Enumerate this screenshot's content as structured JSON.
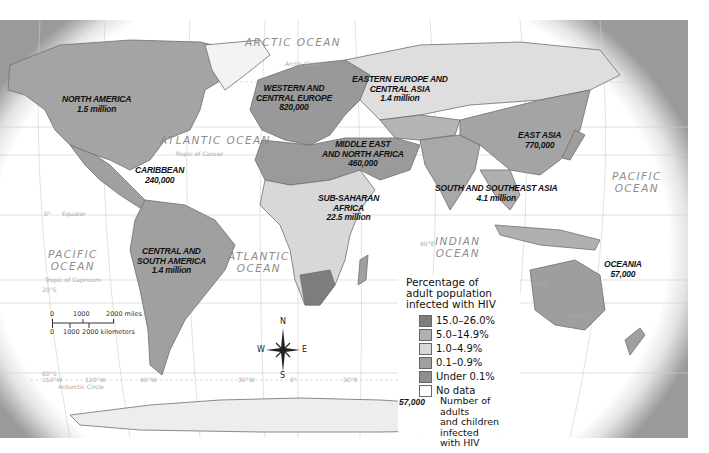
{
  "map": {
    "title": "Adults and children infected with HIV by world region",
    "regions": [
      {
        "name": "NORTH AMERICA",
        "value": "1.5 million"
      },
      {
        "name": "CARIBBEAN",
        "value": "240,000"
      },
      {
        "name": "CENTRAL AND SOUTH AMERICA",
        "value": "1.4 million"
      },
      {
        "name": "WESTERN AND CENTRAL EUROPE",
        "value": "820,000"
      },
      {
        "name": "EASTERN EUROPE AND CENTRAL ASIA",
        "value": "1.4 million"
      },
      {
        "name": "MIDDLE EAST AND NORTH AFRICA",
        "value": "460,000"
      },
      {
        "name": "SUB-SAHARAN AFRICA",
        "value": "22.5 million"
      },
      {
        "name": "SOUTH AND SOUTHEAST ASIA",
        "value": "4.1 million"
      },
      {
        "name": "EAST ASIA",
        "value": "770,000"
      },
      {
        "name": "OCEANIA",
        "value": "57,000"
      }
    ],
    "labels": {
      "na_l1": "NORTH AMERICA",
      "na_v": "1.5 million",
      "car_l1": "CARIBBEAN",
      "car_v": "240,000",
      "csa_l1": "CENTRAL AND",
      "csa_l2": "SOUTH AMERICA",
      "csa_v": "1.4 million",
      "wce_l1": "WESTERN AND",
      "wce_l2": "CENTRAL EUROPE",
      "wce_v": "820,000",
      "eeca_l1": "EASTERN EUROPE AND",
      "eeca_l2": "CENTRAL ASIA",
      "eeca_v": "1.4 million",
      "mena_l1": "MIDDLE EAST",
      "mena_l2": "AND NORTH AFRICA",
      "mena_v": "460,000",
      "ssa_l1": "SUB-SAHARAN",
      "ssa_l2": "AFRICA",
      "ssa_v": "22.5 million",
      "ssea_l1": "SOUTH AND SOUTHEAST ASIA",
      "ssea_v": "4.1 million",
      "ea_l1": "EAST ASIA",
      "ea_v": "770,000",
      "oc_l1": "OCEANIA",
      "oc_v": "57,000"
    },
    "oceans": {
      "arctic": "ARCTIC OCEAN",
      "atlantic_n": "ATLANTIC OCEAN",
      "atlantic_s1": "ATLANTIC",
      "atlantic_s2": "OCEAN",
      "pacific_w1": "PACIFIC",
      "pacific_w2": "OCEAN",
      "pacific_e1": "PACIFIC",
      "pacific_e2": "OCEAN",
      "indian1": "INDIAN",
      "indian2": "OCEAN"
    },
    "grid": {
      "arctic_circle": "Arctic Circle",
      "tropic_cancer": "Tropic of Cancer",
      "equator": "Equator",
      "tropic_capricorn": "Tropic of Capricorn",
      "antarctic_circle": "Antarctic Circle",
      "lat_0": "0°",
      "lat_20n": "20°N",
      "lat_20s": "20°S",
      "lat_60s": "60°S",
      "lon_150w": "150°W",
      "lon_120w": "120°W",
      "lon_90w": "90°W",
      "lon_30w": "30°W",
      "lon_0": "0°",
      "lon_30e": "30°E",
      "lon_90e": "90°E",
      "lon_120e": "120°E",
      "lon_150e": "150°E"
    },
    "compass": {
      "n": "N",
      "s": "S",
      "e": "E",
      "w": "W"
    },
    "scale": {
      "miles_0": "0",
      "miles_1000": "1000",
      "miles_2000": "2000 miles",
      "km_0": "0",
      "km_1000": "1000",
      "km_2000": "2000 kilometers"
    }
  },
  "legend": {
    "title_l1": "Percentage of",
    "title_l2": "adult population",
    "title_l3": "infected with HIV",
    "items": [
      {
        "label": "15.0–26.0%",
        "color": "#7d7d7d"
      },
      {
        "label": "5.0–14.9%",
        "color": "#b0b0b0"
      },
      {
        "label": "1.0–4.9%",
        "color": "#d8d8d8"
      },
      {
        "label": "0.1–0.9%",
        "color": "#a0a0a0"
      },
      {
        "label": "Under 0.1%",
        "color": "#8e8e8e"
      },
      {
        "label": "No data",
        "color": "#ffffff"
      }
    ],
    "example_number": "57,000",
    "example_l1": "Number of adults",
    "example_l2": "and children infected",
    "example_l3": "with HIV"
  }
}
